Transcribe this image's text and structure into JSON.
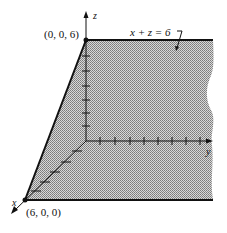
{
  "figure": {
    "type": "3d-plane-diagram",
    "plane_equation": "x + z = 6",
    "axes": {
      "x": "x",
      "y": "y",
      "z": "z"
    },
    "points": [
      {
        "label": "(0, 0, 6)",
        "coords": [
          0,
          0,
          6
        ]
      },
      {
        "label": "(6, 0, 0)",
        "coords": [
          6,
          0,
          0
        ]
      }
    ],
    "z_ticks": 6,
    "x_ticks": 6,
    "y_ticks": 9,
    "colors": {
      "shading": "#b8b8b8",
      "line": "#111111"
    }
  }
}
